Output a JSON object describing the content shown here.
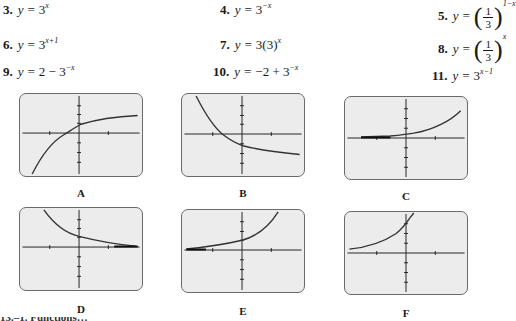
{
  "equations": [
    {
      "num": "3.",
      "lhs": "y =",
      "base": "3",
      "exp": "x"
    },
    {
      "num": "4.",
      "lhs": "y =",
      "base": "3",
      "exp": "−x"
    },
    {
      "num": "5.",
      "lhs": "y =",
      "frac_num": "1",
      "frac_den": "3",
      "exp": "1−x"
    },
    {
      "num": "6.",
      "lhs": "y =",
      "base": "3",
      "exp": "x+1"
    },
    {
      "num": "7.",
      "lhs": "y =",
      "base": "3(3)",
      "exp": "x"
    },
    {
      "num": "8.",
      "lhs": "y =",
      "frac_num": "1",
      "frac_den": "3",
      "exp": "x"
    },
    {
      "num": "9.",
      "lhs": "y =",
      "prefix": "2 − ",
      "base": "3",
      "exp": "−x"
    },
    {
      "num": "10.",
      "lhs": "y =",
      "prefix": "−2 + ",
      "base": "3",
      "exp": "−x"
    },
    {
      "num": "11.",
      "lhs": "y =",
      "base": "3",
      "exp": "x−1"
    }
  ],
  "graphs": [
    {
      "label": "A",
      "description": "increasing concave-down curve, horizontal asymptote above x-axis (y = 2 − 3^−x)"
    },
    {
      "label": "B",
      "description": "decreasing curve approaching asymptote below x-axis (y = −2 + 3^−x)"
    },
    {
      "label": "C",
      "description": "increasing exponential, small near left, y-intercept about 1/3 (y = 3^(x−1))"
    },
    {
      "label": "D",
      "description": "decreasing exponential approaching x-axis, y-intercept 1"
    },
    {
      "label": "E",
      "description": "increasing exponential, y-intercept 1"
    },
    {
      "label": "F",
      "description": "increasing exponential steep, y-intercept 3"
    }
  ],
  "footer_clipped": "13.–1. Functions…"
}
